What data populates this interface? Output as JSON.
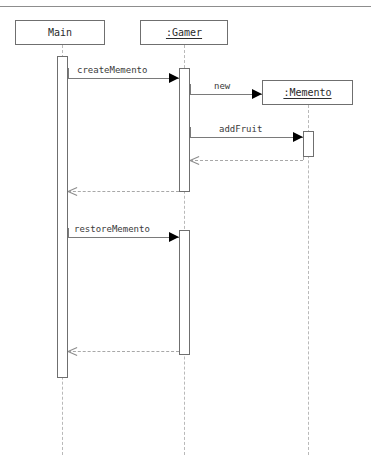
{
  "header": {
    "fragment_text": "··· ·· ···· ·· ·· ···"
  },
  "diagram": {
    "type": "uml-sequence-diagram",
    "participants": [
      {
        "id": "main",
        "label": "Main",
        "underlined": false,
        "box": {
          "x": 15,
          "y": 20,
          "w": 90,
          "h": 25
        },
        "lifeline_x": 62,
        "lifeline_bottom": 455
      },
      {
        "id": "gamer",
        "label": ":Gamer",
        "underlined": true,
        "box": {
          "x": 140,
          "y": 20,
          "w": 88,
          "h": 25
        },
        "lifeline_x": 184,
        "lifeline_bottom": 455
      },
      {
        "id": "memento",
        "label": ":Memento",
        "underlined": true,
        "box": {
          "x": 262,
          "y": 80,
          "w": 91,
          "h": 25
        },
        "lifeline_x": 308,
        "lifeline_bottom": 455
      }
    ],
    "activations": [
      {
        "id": "act-main",
        "participant": "main",
        "x": 57,
        "y": 56,
        "h": 322
      },
      {
        "id": "act-gamer-1",
        "participant": "gamer",
        "x": 179,
        "y": 68,
        "h": 124
      },
      {
        "id": "act-gamer-2",
        "participant": "gamer",
        "x": 179,
        "y": 230,
        "h": 125
      },
      {
        "id": "act-memento",
        "participant": "memento",
        "x": 303,
        "y": 131,
        "h": 26
      }
    ],
    "messages": [
      {
        "id": "m1",
        "label": "createMemento",
        "kind": "call",
        "from": "main",
        "to": "gamer",
        "from_x": 68,
        "to_x": 179,
        "y": 78,
        "label_x": 77,
        "label_y": 65,
        "stub_top": 68
      },
      {
        "id": "m2",
        "label": "new",
        "kind": "call",
        "from": "gamer",
        "to": "memento",
        "from_x": 190,
        "to_x": 262,
        "y": 94,
        "label_x": 214,
        "label_y": 81,
        "stub_top": 84
      },
      {
        "id": "m3",
        "label": "addFruit",
        "kind": "call",
        "from": "gamer",
        "to": "memento",
        "from_x": 190,
        "to_x": 303,
        "y": 137,
        "label_x": 219,
        "label_y": 124,
        "stub_top": 127
      },
      {
        "id": "m4",
        "label": "",
        "kind": "return",
        "from": "memento",
        "to": "gamer",
        "from_x": 303,
        "to_x": 190,
        "y": 160,
        "label_x": 0,
        "label_y": 0,
        "stub_top": 157
      },
      {
        "id": "m5",
        "label": "",
        "kind": "return",
        "from": "gamer",
        "to": "main",
        "from_x": 179,
        "to_x": 68,
        "y": 191,
        "label_x": 0,
        "label_y": 0,
        "stub_top": 186
      },
      {
        "id": "m6",
        "label": "restoreMemento",
        "kind": "call",
        "from": "main",
        "to": "gamer",
        "from_x": 68,
        "to_x": 179,
        "y": 237,
        "label_x": 74,
        "label_y": 224,
        "stub_top": 228
      },
      {
        "id": "m7",
        "label": "",
        "kind": "return",
        "from": "gamer",
        "to": "main",
        "from_x": 179,
        "to_x": 68,
        "y": 351,
        "label_x": 0,
        "label_y": 0,
        "stub_top": 346
      }
    ]
  }
}
